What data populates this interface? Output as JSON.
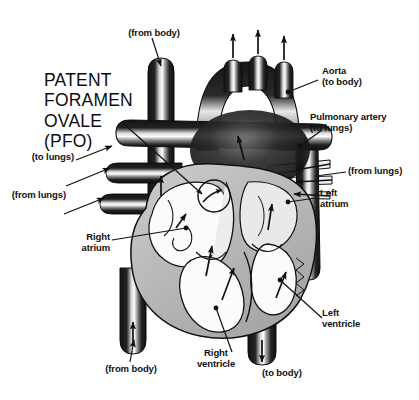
{
  "figure": {
    "title": "PATENT\nFORAMEN\nOVALE\n(PFO)",
    "background_color": "#ffffff",
    "ink_color": "#111111",
    "palette": {
      "vessel_dark": "#1a1a1a",
      "vessel_highlight": "#ffffff",
      "myocardium_gray": "#b9b9b9",
      "myocardium_light": "#d6d6d6",
      "chamber_white": "#fbfbfb",
      "outline": "#111111"
    }
  },
  "labels": {
    "from_body_top": "(from body)",
    "to_lungs_left": "(to lungs)",
    "from_lungs_left": "(from lungs)",
    "right_atrium": "Right\natrium",
    "from_body_bottom": "(from body)",
    "right_ventricle": "Right\nventricle",
    "to_body_bottom": "(to body)",
    "left_ventricle": "Left\nventricle",
    "left_atrium": "Left\natrium",
    "from_lungs_right": "(from lungs)",
    "pulmonary_artery": "Pulmonary artery\n(to lungs)",
    "aorta": "Aorta\n(to body)"
  },
  "structures": [
    "aortic arch",
    "brachiocephalic / carotid / subclavian branches",
    "superior vena cava",
    "inferior vena cava",
    "pulmonary artery",
    "pulmonary veins",
    "right atrium",
    "left atrium",
    "right ventricle",
    "left ventricle",
    "interatrial septum",
    "patent foramen ovale"
  ],
  "flow_arrows": {
    "count": 18,
    "description": "black directional arrows indicating blood flow through vessels and chambers, including one arrow passing through the patent foramen ovale from right atrium to left atrium"
  }
}
